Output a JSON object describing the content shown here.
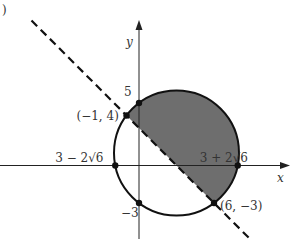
{
  "figure": {
    "part_marker": ")",
    "axes": {
      "x_label": "x",
      "y_label": "y"
    },
    "circle": {
      "center": [
        3,
        1
      ],
      "radius": 5
    },
    "line": {
      "equation": "y = -x + 3",
      "style": "dashed"
    },
    "shaded_region": "inside circle, above line",
    "points": [
      {
        "id": "p-neg1-4",
        "coords": [
          -1,
          4
        ],
        "label": "(−1, 4)"
      },
      {
        "id": "p-6-neg3",
        "coords": [
          6,
          -3
        ],
        "label": "(6, −3)"
      },
      {
        "id": "y-int-5",
        "coords": [
          0,
          5
        ],
        "label": "5"
      },
      {
        "id": "y-int-neg3",
        "coords": [
          0,
          -3
        ],
        "label": "−3"
      },
      {
        "id": "x-int-left",
        "coords": [
          -1.899,
          0
        ],
        "label": "3 − 2√6"
      },
      {
        "id": "x-int-right",
        "coords": [
          7.899,
          0
        ],
        "label": "3 + 2√6"
      }
    ],
    "colors": {
      "shade": "#6e6e6e",
      "stroke": "#111111"
    }
  }
}
